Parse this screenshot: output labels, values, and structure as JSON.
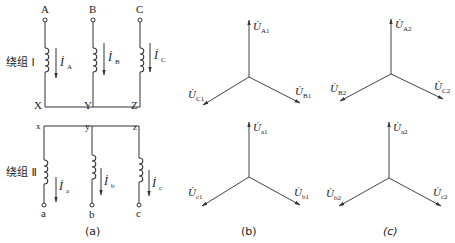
{
  "figure": {
    "panel_a": {
      "caption": "(a)",
      "winding1": {
        "label": "绕组 Ⅰ",
        "terminals_top": [
          "A",
          "B",
          "C"
        ],
        "neutral_labels": [
          "X",
          "Y",
          "Z"
        ],
        "currents": [
          {
            "symbol": "İ",
            "sub": "A"
          },
          {
            "symbol": "İ",
            "sub": "B"
          },
          {
            "symbol": "İ",
            "sub": "C"
          }
        ]
      },
      "winding2": {
        "label": "绕组 Ⅱ",
        "neutral_labels": [
          "x",
          "y",
          "z"
        ],
        "terminals_bottom": [
          "a",
          "b",
          "c"
        ],
        "currents": [
          {
            "symbol": "İ",
            "sub": "a"
          },
          {
            "symbol": "İ",
            "sub": "b"
          },
          {
            "symbol": "İ",
            "sub": "c"
          }
        ]
      }
    },
    "panel_b": {
      "caption": "(b)",
      "top_star": [
        {
          "symbol": "U̇",
          "sub": "A1"
        },
        {
          "symbol": "U̇",
          "sub": "B1"
        },
        {
          "symbol": "U̇",
          "sub": "C1"
        }
      ],
      "bottom_star": [
        {
          "symbol": "U̇",
          "sub": "a1"
        },
        {
          "symbol": "U̇",
          "sub": "b1"
        },
        {
          "symbol": "U̇",
          "sub": "c1"
        }
      ]
    },
    "panel_c": {
      "caption": "(c)",
      "top_star": [
        {
          "symbol": "U̇",
          "sub": "A2"
        },
        {
          "symbol": "U̇",
          "sub": "B2"
        },
        {
          "symbol": "U̇",
          "sub": "C2"
        }
      ],
      "bottom_star": [
        {
          "symbol": "U̇",
          "sub": "a2"
        },
        {
          "symbol": "U̇",
          "sub": "b2"
        },
        {
          "symbol": "U̇",
          "sub": "c2"
        }
      ]
    }
  }
}
